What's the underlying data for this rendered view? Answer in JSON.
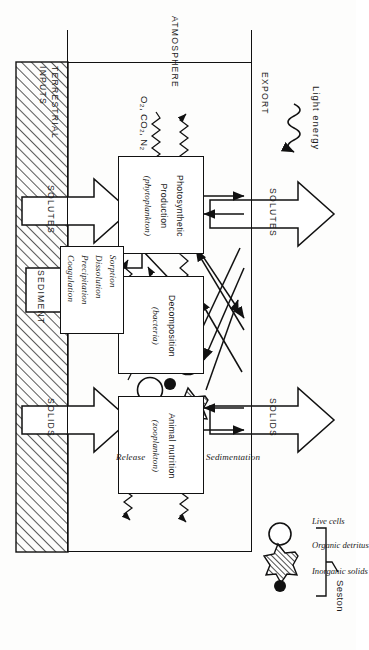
{
  "figure": {
    "type": "conceptual-flow-diagram"
  },
  "boundaries": {
    "top_label": "EXPORT",
    "bottom_label_line1": "TERRESTRIAL",
    "bottom_label_line2": "INPUTS",
    "left_label": "ATMOSPHERE",
    "right_label": "SEDIMENT"
  },
  "gases": "O₂, CO₂, N₂",
  "light": {
    "label": "Light energy"
  },
  "export_arrows": [
    {
      "label": "SOLUTES"
    },
    {
      "label": "SOLIDS"
    }
  ],
  "input_arrows": [
    {
      "label": "SOLUTES"
    },
    {
      "label": "SOLIDS"
    }
  ],
  "process_boxes": [
    {
      "line1": "Photosynthetic",
      "line2": "Production",
      "line3": "(phytoplankton)"
    },
    {
      "line1": "Decomposition",
      "line2": "(bacteria)",
      "line3": ""
    },
    {
      "line1": "Animal nutrition",
      "line2": "(zooplankton)",
      "line3": ""
    }
  ],
  "chemistry_box": {
    "lines": [
      "Sorption",
      "Dissolution",
      "Precipitation",
      "Coagulation"
    ]
  },
  "sediment_fluxes": [
    {
      "label": "Sedimentation"
    },
    {
      "label": "Release"
    }
  ],
  "legend": {
    "bracket_label": "Seston",
    "items": [
      {
        "label": "Live cells",
        "symbol": "open-circle"
      },
      {
        "label": "Organic detritus",
        "symbol": "hatched-star"
      },
      {
        "label": "Inorganic solids",
        "symbol": "filled-dot"
      }
    ]
  },
  "colors": {
    "ink": "#111111",
    "paper": "#fdfdfc",
    "hatch": "#222222"
  }
}
